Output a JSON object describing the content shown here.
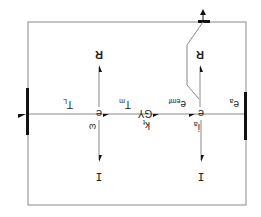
{
  "diagram": {
    "orientation": "rotated 180 degrees",
    "colors": {
      "line": "#8a8a8a",
      "thick_bar": "#111111",
      "text": "#222222"
    },
    "junctions": [
      {
        "id": "left-junction",
        "label": "e"
      },
      {
        "id": "right-junction",
        "label": "e"
      }
    ],
    "labels": {
      "left_R": "R",
      "right_R": "R",
      "left_I": "I",
      "right_I": "I",
      "omega": "ω",
      "i_a": "i",
      "i_a_sub": "a",
      "T_L": "T",
      "T_L_sub": "L",
      "T_m": "T",
      "T_m_sub": "m",
      "gyrator": "GY",
      "k_t": "k",
      "k_t_sub": "t",
      "e_emf": "e",
      "e_emf_sub": "emf",
      "e_a": "e",
      "e_a_sub": "a"
    }
  }
}
